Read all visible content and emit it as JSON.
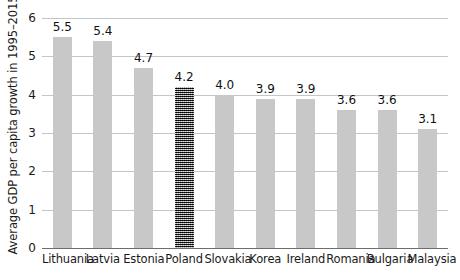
{
  "chart_data": {
    "type": "bar",
    "title": "",
    "xlabel": "",
    "ylabel": "Average GDP per capita growth in 1995–2015",
    "categories": [
      "Lithuania",
      "Latvia",
      "Estonia",
      "Poland",
      "Slovakia",
      "Korea",
      "Ireland",
      "Romania",
      "Bulgaria",
      "Malaysia"
    ],
    "values": [
      5.5,
      5.4,
      4.7,
      4.2,
      4.0,
      3.9,
      3.9,
      3.6,
      3.6,
      3.1
    ],
    "value_labels": [
      "5.5",
      "5.4",
      "4.7",
      "4.2",
      "4.0",
      "3.9",
      "3.9",
      "3.6",
      "3.6",
      "3.1"
    ],
    "highlighted_category": "Poland",
    "ylim": [
      0,
      6
    ],
    "yticks": [
      0,
      1,
      2,
      3,
      4,
      5,
      6
    ],
    "ytick_labels": [
      "0",
      "1",
      "2",
      "3",
      "4",
      "5",
      "6"
    ],
    "grid": true,
    "legend": false,
    "colors": {
      "bar": "#c8c8c8",
      "bar_highlight": "#3a3a3a",
      "gridline": "#c2c6c9",
      "axis": "#6d6d6d",
      "text": "#1a1a1a",
      "background": "#ffffff"
    }
  }
}
